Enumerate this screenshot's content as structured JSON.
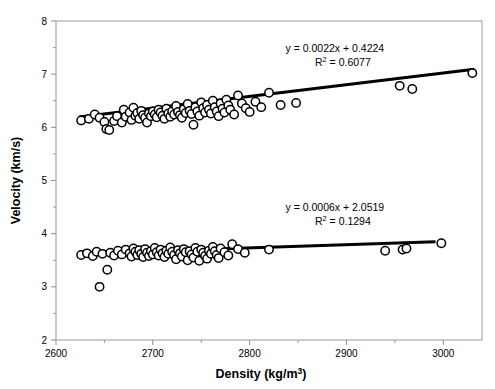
{
  "chart_data": {
    "type": "scatter",
    "title": "",
    "xlabel": "Density (kg/m3)",
    "xlabel_base": "Density (kg/m",
    "xlabel_sup": "3",
    "xlabel_close": ")",
    "ylabel": "Velocity (km/s)",
    "xlim": [
      2600,
      3040
    ],
    "ylim": [
      2,
      8
    ],
    "x_ticks": [
      2600,
      2700,
      2800,
      2900,
      3000
    ],
    "x_tick_labels": [
      "2600",
      "2700",
      "2800",
      "2900",
      "3000"
    ],
    "x_minor_step": 50,
    "y_ticks": [
      2,
      3,
      4,
      5,
      6,
      7,
      8
    ],
    "y_tick_labels": [
      "2",
      "3",
      "4",
      "5",
      "6",
      "7",
      "8"
    ],
    "grid": false,
    "legend": "none",
    "marker": "open-circle",
    "marker_size": 4.2,
    "series": [
      {
        "name": "P-wave velocity",
        "annotation_equation": "y = 0.0022x + 0.4224",
        "annotation_r2_label": "R",
        "annotation_r2_sup": "2",
        "annotation_r2_value": " = 0.6077",
        "annotation_x": 2888,
        "annotation_y": 7.42,
        "fit_slope": 0.0022,
        "fit_intercept": 0.4224,
        "fit_r2": 0.6077,
        "fit_x_range": [
          2624,
          3032
        ],
        "points": [
          [
            2626,
            6.13
          ],
          [
            2634,
            6.16
          ],
          [
            2640,
            6.24
          ],
          [
            2645,
            6.18
          ],
          [
            2650,
            6.1
          ],
          [
            2652,
            5.97
          ],
          [
            2655,
            5.95
          ],
          [
            2660,
            6.12
          ],
          [
            2663,
            6.21
          ],
          [
            2668,
            6.09
          ],
          [
            2670,
            6.33
          ],
          [
            2672,
            6.2
          ],
          [
            2676,
            6.28
          ],
          [
            2678,
            6.14
          ],
          [
            2680,
            6.37
          ],
          [
            2682,
            6.22
          ],
          [
            2684,
            6.27
          ],
          [
            2686,
            6.16
          ],
          [
            2688,
            6.31
          ],
          [
            2690,
            6.23
          ],
          [
            2692,
            6.18
          ],
          [
            2694,
            6.09
          ],
          [
            2696,
            6.26
          ],
          [
            2698,
            6.21
          ],
          [
            2700,
            6.3
          ],
          [
            2702,
            6.24
          ],
          [
            2704,
            6.19
          ],
          [
            2706,
            6.33
          ],
          [
            2708,
            6.28
          ],
          [
            2710,
            6.22
          ],
          [
            2712,
            6.16
          ],
          [
            2714,
            6.35
          ],
          [
            2716,
            6.26
          ],
          [
            2718,
            6.2
          ],
          [
            2720,
            6.3
          ],
          [
            2722,
            6.24
          ],
          [
            2724,
            6.4
          ],
          [
            2726,
            6.29
          ],
          [
            2728,
            6.23
          ],
          [
            2730,
            6.18
          ],
          [
            2732,
            6.34
          ],
          [
            2734,
            6.27
          ],
          [
            2736,
            6.44
          ],
          [
            2738,
            6.31
          ],
          [
            2740,
            6.25
          ],
          [
            2742,
            6.05
          ],
          [
            2744,
            6.38
          ],
          [
            2746,
            6.3
          ],
          [
            2748,
            6.22
          ],
          [
            2750,
            6.47
          ],
          [
            2752,
            6.36
          ],
          [
            2754,
            6.28
          ],
          [
            2756,
            6.42
          ],
          [
            2758,
            6.33
          ],
          [
            2760,
            6.26
          ],
          [
            2762,
            6.5
          ],
          [
            2764,
            6.38
          ],
          [
            2766,
            6.3
          ],
          [
            2768,
            6.21
          ],
          [
            2770,
            6.45
          ],
          [
            2772,
            6.35
          ],
          [
            2774,
            6.28
          ],
          [
            2776,
            6.52
          ],
          [
            2778,
            6.41
          ],
          [
            2780,
            6.33
          ],
          [
            2784,
            6.24
          ],
          [
            2788,
            6.6
          ],
          [
            2792,
            6.45
          ],
          [
            2796,
            6.36
          ],
          [
            2800,
            6.29
          ],
          [
            2806,
            6.48
          ],
          [
            2812,
            6.38
          ],
          [
            2820,
            6.65
          ],
          [
            2832,
            6.42
          ],
          [
            2848,
            6.46
          ],
          [
            2955,
            6.78
          ],
          [
            2968,
            6.72
          ],
          [
            3030,
            7.02
          ]
        ]
      },
      {
        "name": "S-wave velocity",
        "annotation_equation": "y = 0.0006x + 2.0519",
        "annotation_r2_label": "R",
        "annotation_r2_sup": "2",
        "annotation_r2_value": " = 0.1294",
        "annotation_x": 2888,
        "annotation_y": 4.42,
        "fit_slope": 0.0006,
        "fit_intercept": 2.0519,
        "fit_r2": 0.1294,
        "fit_x_range": [
          2624,
          2992
        ],
        "points": [
          [
            2626,
            3.6
          ],
          [
            2632,
            3.63
          ],
          [
            2638,
            3.58
          ],
          [
            2642,
            3.66
          ],
          [
            2645,
            3.0
          ],
          [
            2648,
            3.62
          ],
          [
            2653,
            3.32
          ],
          [
            2656,
            3.64
          ],
          [
            2660,
            3.59
          ],
          [
            2664,
            3.68
          ],
          [
            2668,
            3.61
          ],
          [
            2672,
            3.7
          ],
          [
            2676,
            3.63
          ],
          [
            2678,
            3.57
          ],
          [
            2680,
            3.72
          ],
          [
            2682,
            3.66
          ],
          [
            2684,
            3.6
          ],
          [
            2686,
            3.69
          ],
          [
            2688,
            3.62
          ],
          [
            2690,
            3.56
          ],
          [
            2692,
            3.71
          ],
          [
            2694,
            3.64
          ],
          [
            2696,
            3.58
          ],
          [
            2698,
            3.67
          ],
          [
            2700,
            3.61
          ],
          [
            2702,
            3.73
          ],
          [
            2704,
            3.65
          ],
          [
            2706,
            3.59
          ],
          [
            2708,
            3.7
          ],
          [
            2710,
            3.63
          ],
          [
            2712,
            3.56
          ],
          [
            2714,
            3.68
          ],
          [
            2716,
            3.62
          ],
          [
            2718,
            3.74
          ],
          [
            2720,
            3.66
          ],
          [
            2722,
            3.6
          ],
          [
            2724,
            3.52
          ],
          [
            2726,
            3.69
          ],
          [
            2728,
            3.63
          ],
          [
            2730,
            3.57
          ],
          [
            2732,
            3.71
          ],
          [
            2734,
            3.65
          ],
          [
            2736,
            3.5
          ],
          [
            2738,
            3.67
          ],
          [
            2740,
            3.61
          ],
          [
            2742,
            3.55
          ],
          [
            2744,
            3.73
          ],
          [
            2746,
            3.66
          ],
          [
            2748,
            3.49
          ],
          [
            2750,
            3.7
          ],
          [
            2752,
            3.64
          ],
          [
            2754,
            3.58
          ],
          [
            2756,
            3.53
          ],
          [
            2758,
            3.68
          ],
          [
            2760,
            3.62
          ],
          [
            2762,
            3.75
          ],
          [
            2764,
            3.67
          ],
          [
            2766,
            3.6
          ],
          [
            2768,
            3.54
          ],
          [
            2770,
            3.72
          ],
          [
            2774,
            3.65
          ],
          [
            2778,
            3.59
          ],
          [
            2782,
            3.8
          ],
          [
            2788,
            3.71
          ],
          [
            2795,
            3.64
          ],
          [
            2820,
            3.7
          ],
          [
            2940,
            3.68
          ],
          [
            2958,
            3.7
          ],
          [
            2962,
            3.72
          ],
          [
            2998,
            3.82
          ]
        ]
      }
    ]
  }
}
